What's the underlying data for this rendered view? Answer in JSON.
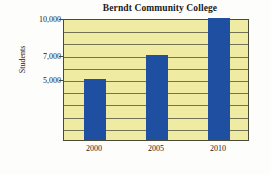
{
  "chart_data": {
    "type": "bar",
    "title": "Berndt Community College",
    "xlabel": "",
    "ylabel": "Students",
    "categories": [
      "2000",
      "2005",
      "2010"
    ],
    "values": [
      5000,
      7000,
      10000
    ],
    "series": [
      {
        "name": "Students",
        "values": [
          5000,
          7000,
          10000
        ]
      }
    ],
    "ylim": [
      0,
      10000
    ],
    "ytick_labels": [
      "10,000",
      "7,000",
      "5,000"
    ],
    "ytick_values": [
      10000,
      7000,
      5000
    ],
    "grid_interval": 1000,
    "grid": true,
    "legend": false,
    "legend_position": "none",
    "colors": {
      "bar": "#1f4fa0",
      "plot_background": "#f0eba2",
      "axis": "#4a4a3a",
      "text": "#1a1a1a",
      "figure_background": "#fdfdfb"
    }
  }
}
